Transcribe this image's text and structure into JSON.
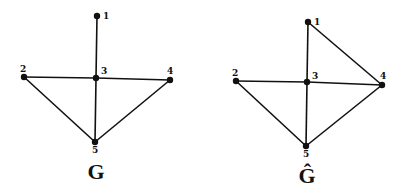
{
  "graphs": [
    {
      "name": "G",
      "label": "G",
      "label_pos": [
        96,
        179
      ],
      "nodes": [
        {
          "id": "1",
          "x": 97,
          "y": 16,
          "lx": 103,
          "ly": 19
        },
        {
          "id": "2",
          "x": 24,
          "y": 77,
          "lx": 20,
          "ly": 72
        },
        {
          "id": "3",
          "x": 96,
          "y": 78,
          "lx": 101,
          "ly": 74
        },
        {
          "id": "4",
          "x": 170,
          "y": 80,
          "lx": 167,
          "ly": 74
        },
        {
          "id": "5",
          "x": 95,
          "y": 142,
          "lx": 92,
          "ly": 153
        }
      ],
      "edges": [
        [
          "1",
          "3"
        ],
        [
          "2",
          "3"
        ],
        [
          "3",
          "4"
        ],
        [
          "3",
          "5"
        ],
        [
          "2",
          "5"
        ],
        [
          "4",
          "5"
        ]
      ]
    },
    {
      "name": "G-hat",
      "label": "Ĝ",
      "label_pos": [
        307,
        183
      ],
      "nodes": [
        {
          "id": "1",
          "x": 308,
          "y": 22,
          "lx": 314,
          "ly": 25
        },
        {
          "id": "2",
          "x": 236,
          "y": 81,
          "lx": 232,
          "ly": 76
        },
        {
          "id": "3",
          "x": 307,
          "y": 82,
          "lx": 312,
          "ly": 79
        },
        {
          "id": "4",
          "x": 382,
          "y": 85,
          "lx": 380,
          "ly": 79
        },
        {
          "id": "5",
          "x": 306,
          "y": 146,
          "lx": 303,
          "ly": 157
        }
      ],
      "edges": [
        [
          "1",
          "3"
        ],
        [
          "1",
          "4"
        ],
        [
          "2",
          "3"
        ],
        [
          "3",
          "4"
        ],
        [
          "3",
          "5"
        ],
        [
          "2",
          "5"
        ],
        [
          "4",
          "5"
        ]
      ]
    }
  ],
  "colors": {
    "ink": "#111111",
    "background": "#ffffff"
  }
}
